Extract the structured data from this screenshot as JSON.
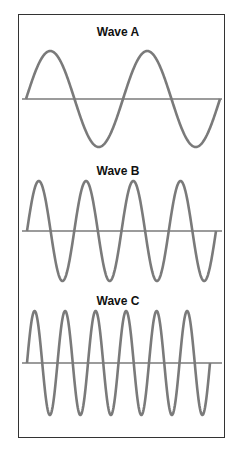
{
  "diagram": {
    "colors": {
      "wave": "#7a7a7a",
      "axis": "#7a7a7a",
      "border": "#333333",
      "label": "#111111",
      "background": "#ffffff"
    },
    "waves": [
      {
        "label": "Wave A",
        "label_y": 25,
        "axis_y": 99,
        "amplitude": 48,
        "x_start": 26,
        "x_end": 220,
        "cycles": 2,
        "axis_x_start": 22,
        "axis_x_end": 222
      },
      {
        "label": "Wave B",
        "label_y": 164,
        "axis_y": 231,
        "amplitude": 50,
        "x_start": 27,
        "x_end": 216,
        "cycles": 4,
        "axis_x_start": 22,
        "axis_x_end": 222
      },
      {
        "label": "Wave C",
        "label_y": 294,
        "axis_y": 363,
        "amplitude": 52,
        "x_start": 27,
        "x_end": 210,
        "cycles": 6,
        "axis_x_start": 22,
        "axis_x_end": 222
      }
    ]
  }
}
